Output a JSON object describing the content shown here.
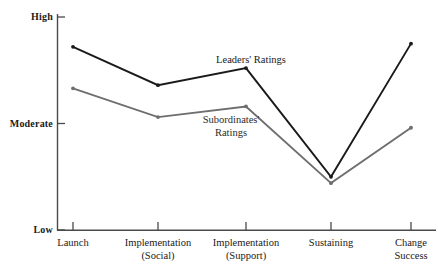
{
  "chart_data": {
    "type": "line",
    "title": "",
    "xlabel": "",
    "ylabel": "",
    "categories": [
      "Launch",
      "Implementation (Social)",
      "Implementation (Support)",
      "Sustaining",
      "Change Success"
    ],
    "category_lines": [
      [
        "Launch",
        ""
      ],
      [
        "Implementation",
        "(Social)"
      ],
      [
        "Implementation",
        "(Support)"
      ],
      [
        "Sustaining",
        ""
      ],
      [
        "Change",
        "Success"
      ]
    ],
    "y_tick_labels": [
      "High",
      "Moderate",
      "Low"
    ],
    "y_tick_values": [
      3,
      2,
      1
    ],
    "ylim": [
      1,
      3.12
    ],
    "grid": false,
    "legend": "inline-annotations",
    "series": [
      {
        "name": "Leaders' Ratings",
        "color": "#1a1a1a",
        "values": [
          2.72,
          2.36,
          2.52,
          1.5,
          2.75
        ]
      },
      {
        "name": "Subordinates' Ratings",
        "color": "#6e6e6e",
        "values": [
          2.33,
          2.06,
          2.16,
          1.44,
          1.96
        ]
      }
    ],
    "annotations": [
      {
        "id": "leaders",
        "text": "Leaders' Ratings",
        "lines": [
          "Leaders' Ratings"
        ]
      },
      {
        "id": "subordinates",
        "text": "Subordinates' Ratings",
        "lines": [
          "Subordinates'",
          "Ratings"
        ]
      }
    ]
  },
  "axis": {
    "y_high": "High",
    "y_moderate": "Moderate",
    "y_low": "Low"
  },
  "categories": {
    "c0_l1": "Launch",
    "c0_l2": "",
    "c1_l1": "Implementation",
    "c1_l2": "(Social)",
    "c2_l1": "Implementation",
    "c2_l2": "(Support)",
    "c3_l1": "Sustaining",
    "c3_l2": "",
    "c4_l1": "Change",
    "c4_l2": "Success"
  },
  "annotations": {
    "leaders": "Leaders' Ratings",
    "subordinates_l1": "Subordinates'",
    "subordinates_l2": "Ratings"
  },
  "colors": {
    "leaders_line": "#1a1a1a",
    "subordinates_line": "#6e6e6e",
    "axis": "#4a4a4a",
    "background": "#ffffff"
  }
}
